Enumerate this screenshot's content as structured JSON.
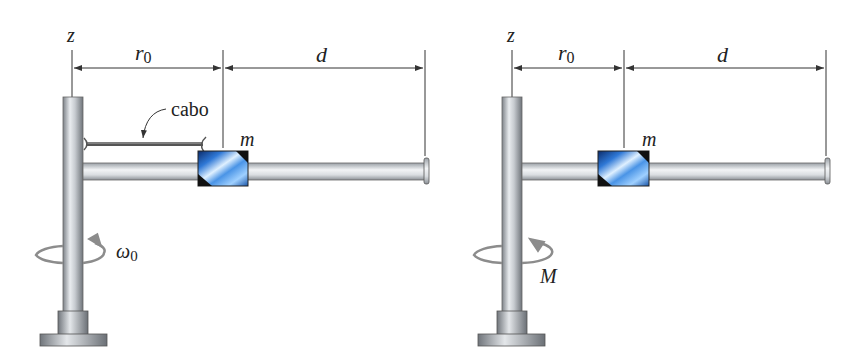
{
  "figures": [
    {
      "id": "left",
      "axis_label": "z",
      "dim_labels": {
        "r": "r",
        "r_sub": "0",
        "d": "d"
      },
      "mass_label": "m",
      "cable_label": "cabo",
      "rotation_label": "ω",
      "rotation_sub": "0",
      "has_cable": true
    },
    {
      "id": "right",
      "axis_label": "z",
      "dim_labels": {
        "r": "r",
        "r_sub": "0",
        "d": "d"
      },
      "mass_label": "m",
      "rotation_label": "M",
      "rotation_sub": "",
      "has_cable": false
    }
  ],
  "colors": {
    "metal_dark": "#8a8f96",
    "metal_light": "#eef0f2",
    "mass_blue": "#2f78d6",
    "mass_black": "#111111",
    "line": "#333333",
    "arrow_gray": "#8c8c8c"
  }
}
